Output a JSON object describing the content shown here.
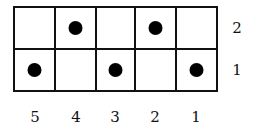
{
  "diagram": {
    "columns": [
      "5",
      "4",
      "3",
      "2",
      "1"
    ],
    "rows": [
      "2",
      "1"
    ],
    "grid": [
      [
        false,
        true,
        false,
        true,
        false
      ],
      [
        true,
        false,
        true,
        false,
        true
      ]
    ],
    "line_color": "#111111",
    "dot_color": "#000000"
  }
}
